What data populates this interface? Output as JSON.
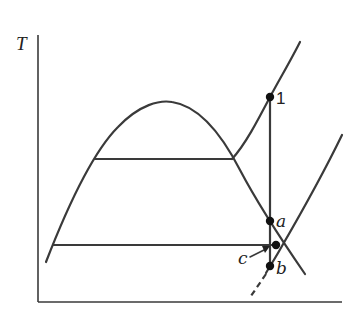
{
  "diagram": {
    "type": "T-s diagram",
    "axes": {
      "y_label": "T",
      "x_label": ""
    },
    "points": [
      {
        "id": "1",
        "label": "1",
        "x": 270,
        "y": 97
      },
      {
        "id": "a",
        "label": "a",
        "x": 270,
        "y": 221
      },
      {
        "id": "c",
        "label": "c",
        "x": 276,
        "y": 245
      },
      {
        "id": "b",
        "label": "b",
        "x": 270,
        "y": 266
      }
    ],
    "curves": [
      {
        "name": "saturation-dome"
      },
      {
        "name": "upper-isobar-horizontal"
      },
      {
        "name": "lower-isobar-horizontal"
      },
      {
        "name": "superheated-isobar"
      },
      {
        "name": "isentropic-expansion-line"
      },
      {
        "name": "second-isobar-curve"
      },
      {
        "name": "dashed-extension"
      }
    ],
    "annotations": [
      {
        "label": "c",
        "arrow_to": "c"
      }
    ]
  }
}
